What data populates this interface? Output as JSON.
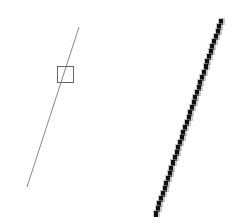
{
  "diagram": {
    "background": "#ffffff",
    "left_panel": {
      "line": {
        "x1": 79,
        "y1": 27,
        "x2": 27,
        "y2": 187,
        "color": "#888888",
        "width": 1
      },
      "square": {
        "x": 57,
        "y": 66,
        "size": 16,
        "stroke": "#666666"
      }
    },
    "right_panel": {
      "line": {
        "x1": 220,
        "y1": 19,
        "x2": 155,
        "y2": 211,
        "color": "#111111",
        "width": 4,
        "step": 5
      }
    }
  }
}
